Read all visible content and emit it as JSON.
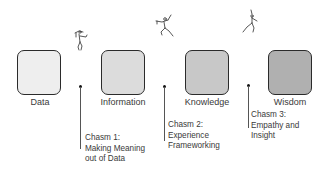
{
  "diagram": {
    "type": "DIKW progression with chasms",
    "stages": [
      {
        "label": "Data",
        "fill": "#eeeeee"
      },
      {
        "label": "Information",
        "fill": "#dcdcdc"
      },
      {
        "label": "Knowledge",
        "fill": "#c8c8c8"
      },
      {
        "label": "Wisdom",
        "fill": "#b0b0b0"
      }
    ],
    "chasms": [
      {
        "title": "Chasm 1:",
        "line2": "Making Meaning",
        "line3": "out of Data"
      },
      {
        "title": "Chasm 2:",
        "line2": "Experience",
        "line3": "Frameworking"
      },
      {
        "title": "Chasm 3:",
        "line2": "Empathy and",
        "line3": "Insight"
      }
    ],
    "figures": [
      {
        "icon": "jumping-figure-icon"
      },
      {
        "icon": "leaping-figure-icon"
      },
      {
        "icon": "striding-figure-icon"
      }
    ]
  }
}
